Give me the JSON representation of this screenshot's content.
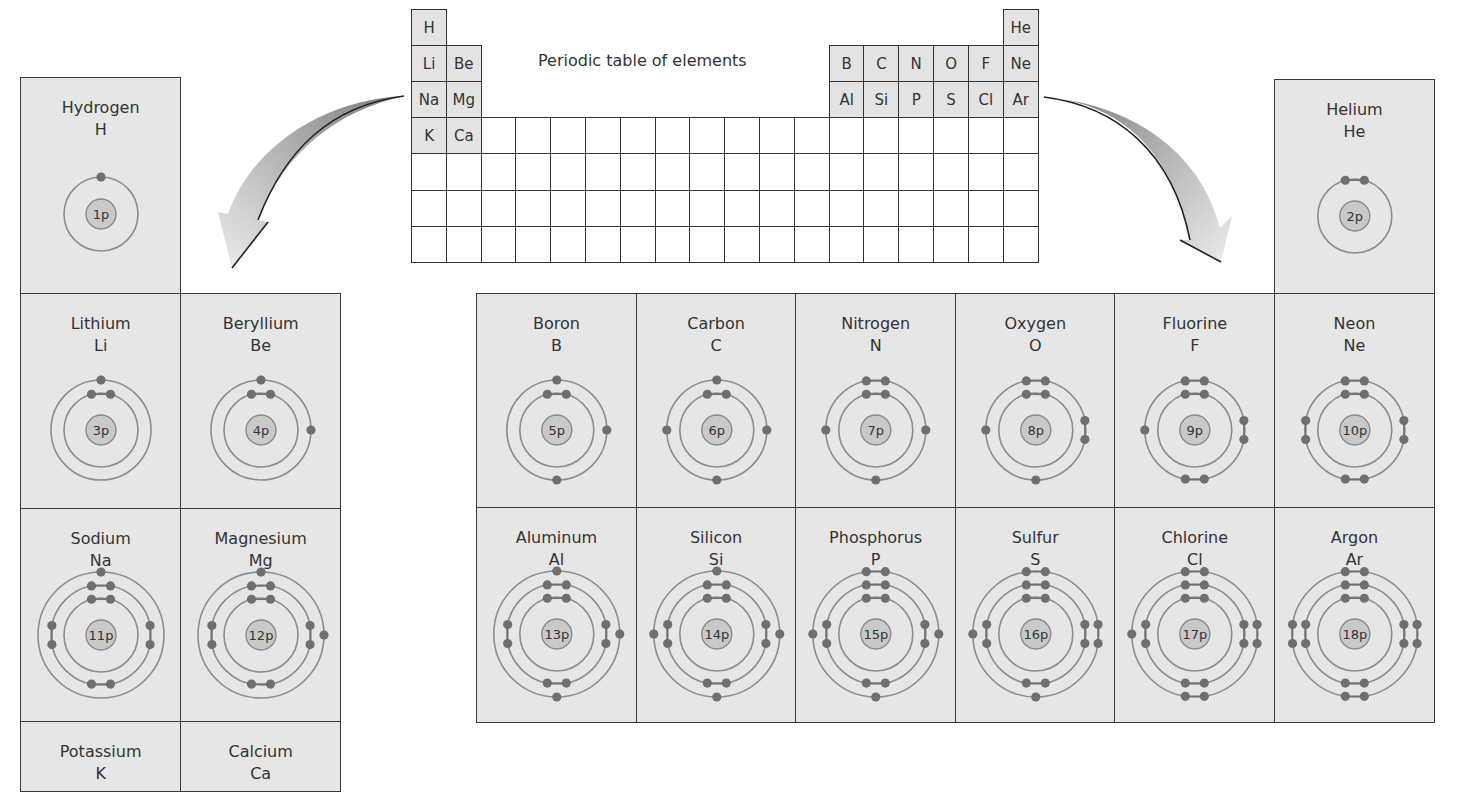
{
  "title": "Periodic table of elements",
  "periodic_table": {
    "rows": 7,
    "columns": 18,
    "labeled_cells": [
      {
        "symbol": "H",
        "row": 0,
        "col": 0
      },
      {
        "symbol": "He",
        "row": 0,
        "col": 17
      },
      {
        "symbol": "Li",
        "row": 1,
        "col": 0
      },
      {
        "symbol": "Be",
        "row": 1,
        "col": 1
      },
      {
        "symbol": "B",
        "row": 1,
        "col": 12
      },
      {
        "symbol": "C",
        "row": 1,
        "col": 13
      },
      {
        "symbol": "N",
        "row": 1,
        "col": 14
      },
      {
        "symbol": "O",
        "row": 1,
        "col": 15
      },
      {
        "symbol": "F",
        "row": 1,
        "col": 16
      },
      {
        "symbol": "Ne",
        "row": 1,
        "col": 17
      },
      {
        "symbol": "Na",
        "row": 2,
        "col": 0
      },
      {
        "symbol": "Mg",
        "row": 2,
        "col": 1
      },
      {
        "symbol": "Al",
        "row": 2,
        "col": 12
      },
      {
        "symbol": "Si",
        "row": 2,
        "col": 13
      },
      {
        "symbol": "P",
        "row": 2,
        "col": 14
      },
      {
        "symbol": "S",
        "row": 2,
        "col": 15
      },
      {
        "symbol": "Cl",
        "row": 2,
        "col": 16
      },
      {
        "symbol": "Ar",
        "row": 2,
        "col": 17
      },
      {
        "symbol": "K",
        "row": 3,
        "col": 0
      },
      {
        "symbol": "Ca",
        "row": 3,
        "col": 1
      }
    ]
  },
  "elements": [
    {
      "id": "hydrogen",
      "name": "Hydrogen",
      "symbol": "H",
      "nucleus": "1p",
      "shells": [
        1
      ]
    },
    {
      "id": "helium",
      "name": "Helium",
      "symbol": "He",
      "nucleus": "2p",
      "shells": [
        2
      ]
    },
    {
      "id": "lithium",
      "name": "Lithium",
      "symbol": "Li",
      "nucleus": "3p",
      "shells": [
        2,
        1
      ]
    },
    {
      "id": "beryllium",
      "name": "Beryllium",
      "symbol": "Be",
      "nucleus": "4p",
      "shells": [
        2,
        2
      ]
    },
    {
      "id": "boron",
      "name": "Boron",
      "symbol": "B",
      "nucleus": "5p",
      "shells": [
        2,
        3
      ]
    },
    {
      "id": "carbon",
      "name": "Carbon",
      "symbol": "C",
      "nucleus": "6p",
      "shells": [
        2,
        4
      ]
    },
    {
      "id": "nitrogen",
      "name": "Nitrogen",
      "symbol": "N",
      "nucleus": "7p",
      "shells": [
        2,
        5
      ]
    },
    {
      "id": "oxygen",
      "name": "Oxygen",
      "symbol": "O",
      "nucleus": "8p",
      "shells": [
        2,
        6
      ]
    },
    {
      "id": "fluorine",
      "name": "Fluorine",
      "symbol": "F",
      "nucleus": "9p",
      "shells": [
        2,
        7
      ]
    },
    {
      "id": "neon",
      "name": "Neon",
      "symbol": "Ne",
      "nucleus": "10p",
      "shells": [
        2,
        8
      ]
    },
    {
      "id": "sodium",
      "name": "Sodium",
      "symbol": "Na",
      "nucleus": "11p",
      "shells": [
        2,
        8,
        1
      ]
    },
    {
      "id": "magnesium",
      "name": "Magnesium",
      "symbol": "Mg",
      "nucleus": "12p",
      "shells": [
        2,
        8,
        2
      ]
    },
    {
      "id": "aluminum",
      "name": "Aluminum",
      "symbol": "Al",
      "nucleus": "13p",
      "shells": [
        2,
        8,
        3
      ]
    },
    {
      "id": "silicon",
      "name": "Silicon",
      "symbol": "Si",
      "nucleus": "14p",
      "shells": [
        2,
        8,
        4
      ]
    },
    {
      "id": "phosphorus",
      "name": "Phosphorus",
      "symbol": "P",
      "nucleus": "15p",
      "shells": [
        2,
        8,
        5
      ]
    },
    {
      "id": "sulfur",
      "name": "Sulfur",
      "symbol": "S",
      "nucleus": "16p",
      "shells": [
        2,
        8,
        6
      ]
    },
    {
      "id": "chlorine",
      "name": "Chlorine",
      "symbol": "Cl",
      "nucleus": "17p",
      "shells": [
        2,
        8,
        7
      ]
    },
    {
      "id": "argon",
      "name": "Argon",
      "symbol": "Ar",
      "nucleus": "18p",
      "shells": [
        2,
        8,
        8
      ]
    },
    {
      "id": "potassium",
      "name": "Potassium",
      "symbol": "K",
      "nucleus": "",
      "shells": []
    },
    {
      "id": "calcium",
      "name": "Calcium",
      "symbol": "Ca",
      "nucleus": "",
      "shells": []
    }
  ],
  "colors": {
    "cell_fill": "#e6e6e6",
    "table_fill": "#e3e3e3",
    "border": "#333333",
    "orbit": "#8c8c8c",
    "electron": "#6f6f6f",
    "nucleus_fill": "#c9c9c9",
    "nucleus_border": "#8a8a8a",
    "arrow_light": "#e8e8e8",
    "arrow_dark": "#8a8a8a"
  }
}
